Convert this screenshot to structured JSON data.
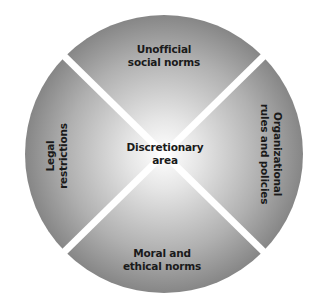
{
  "diagram": {
    "type": "quadrant-circle",
    "center_label": [
      "Discretionary",
      "area"
    ],
    "segments": [
      {
        "position": "top",
        "lines": [
          "Unofficial",
          "social norms"
        ]
      },
      {
        "position": "right",
        "lines": [
          "Organizational",
          "rules and policies"
        ]
      },
      {
        "position": "bottom",
        "lines": [
          "Moral and",
          "ethical norms"
        ]
      },
      {
        "position": "left",
        "lines": [
          "Legal",
          "restrictions"
        ]
      }
    ],
    "colors": {
      "center": "#ffffff",
      "edge": "#8a8a8a",
      "divider": "#ffffff",
      "text": "#1a1a1a"
    }
  }
}
